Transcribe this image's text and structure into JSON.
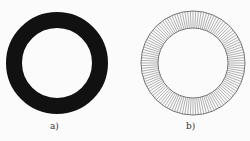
{
  "figures": [
    {
      "label": "a)",
      "style": "solid-black-ring"
    },
    {
      "label": "b)",
      "style": "radially-hatched-ring"
    }
  ],
  "colors": {
    "ring": "#111111",
    "hatch": "#555555",
    "background": "#fbfbfb"
  }
}
